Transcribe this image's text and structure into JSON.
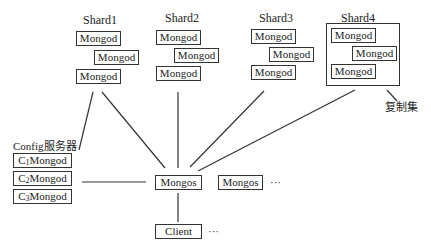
{
  "shards": [
    {
      "label": "Shard1",
      "nodes": [
        "Mongod",
        "Mongod",
        "Mongod"
      ]
    },
    {
      "label": "Shard2",
      "nodes": [
        "Mongod",
        "Mongod",
        "Mongod"
      ]
    },
    {
      "label": "Shard3",
      "nodes": [
        "Mongod",
        "Mongod",
        "Mongod"
      ]
    },
    {
      "label": "Shard4",
      "nodes": [
        "Mongod",
        "Mongod",
        "Mongod"
      ]
    }
  ],
  "replica_set_label": "复制集",
  "config": {
    "title": "Config服务器",
    "servers": [
      {
        "prefix": "C",
        "index": "1",
        "name": "Mongod"
      },
      {
        "prefix": "C",
        "index": "2",
        "name": "Mongod"
      },
      {
        "prefix": "C",
        "index": "3",
        "name": "Mongod"
      }
    ]
  },
  "routers": [
    "Mongos",
    "Mongos"
  ],
  "router_more": "···",
  "client": "Client",
  "client_more": "···",
  "colors": {
    "line": "#333333",
    "background": "#ffffff"
  }
}
